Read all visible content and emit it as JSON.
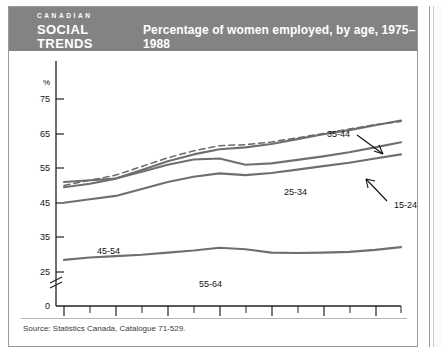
{
  "header": {
    "logo_line1": "CANADIAN",
    "logo_line2": "SOCIAL",
    "logo_line3": "TRENDS",
    "title": "Percentage of women employed, by age, 1975–1988",
    "bg_color": "#838383",
    "text_color": "#ffffff"
  },
  "footer": {
    "source": "Source: Statistics Canada, Catalogue 71-529."
  },
  "axis": {
    "y_unit": "%",
    "y_ticks": [
      "75",
      "65",
      "55",
      "45",
      "35",
      "25",
      "0"
    ],
    "y_break_between": [
      "25",
      "0"
    ],
    "x_ticks": [
      "1975",
      "1977",
      "1979",
      "1981",
      "1983",
      "1985",
      "1987"
    ]
  },
  "annotations": [
    {
      "label": "35-44",
      "x": 318,
      "y": 86
    },
    {
      "label": "25-34",
      "x": 275,
      "y": 144
    },
    {
      "label": "15-24",
      "x": 385,
      "y": 157
    },
    {
      "label": "45-54",
      "x": 88,
      "y": 203
    },
    {
      "label": "55-64",
      "x": 190,
      "y": 236
    }
  ],
  "chart_data": {
    "type": "line",
    "title": "Percentage of women employed, by age, 1975–1988",
    "xlabel": "",
    "ylabel": "%",
    "xlim": [
      1975,
      1988
    ],
    "ylim": [
      25,
      78
    ],
    "y_axis_break": true,
    "grid": false,
    "legend": "inline-labels",
    "x": [
      1975,
      1976,
      1977,
      1978,
      1979,
      1980,
      1981,
      1982,
      1983,
      1984,
      1985,
      1986,
      1987,
      1988
    ],
    "series": [
      {
        "name": "15-24",
        "style": "solid-thick",
        "values": [
          51.0,
          51.5,
          52.0,
          54.0,
          56.0,
          57.5,
          57.8,
          56.0,
          56.4,
          57.4,
          58.4,
          59.6,
          61.0,
          62.5
        ]
      },
      {
        "name": "25-34",
        "style": "dashed",
        "values": [
          50.0,
          51.5,
          53.0,
          55.5,
          58.0,
          60.0,
          61.5,
          61.8,
          62.6,
          63.8,
          65.0,
          66.3,
          67.6,
          68.5
        ]
      },
      {
        "name": "35-44",
        "style": "solid-thick",
        "values": [
          49.5,
          50.5,
          52.0,
          54.5,
          57.0,
          59.0,
          60.5,
          61.0,
          62.0,
          63.4,
          64.8,
          66.0,
          67.4,
          68.8
        ]
      },
      {
        "name": "45-54",
        "style": "solid-thick",
        "values": [
          45.0,
          46.0,
          47.0,
          49.0,
          51.0,
          52.5,
          53.5,
          53.0,
          53.6,
          54.6,
          55.6,
          56.6,
          57.8,
          59.0
        ]
      },
      {
        "name": "55-64",
        "style": "solid-thick",
        "values": [
          28.5,
          29.2,
          29.6,
          30.0,
          30.6,
          31.2,
          32.0,
          31.6,
          30.6,
          30.5,
          30.6,
          30.8,
          31.4,
          32.2
        ]
      }
    ]
  }
}
